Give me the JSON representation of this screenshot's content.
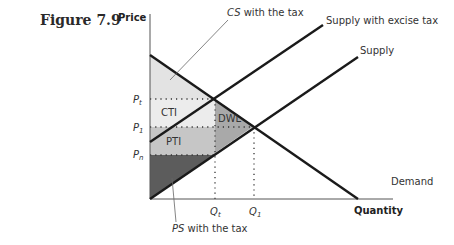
{
  "figure": {
    "title": "Figure 7.9"
  },
  "axes": {
    "y_label": "Price",
    "x_label": "Quantity"
  },
  "curves": {
    "supply_with_tax": "Supply with excise tax",
    "supply": "Supply",
    "demand": "Demand"
  },
  "price_ticks": {
    "pt": "P",
    "pt_sub": "t",
    "p1": "P",
    "p1_sub": "1",
    "pn": "P",
    "pn_sub": "n"
  },
  "quantity_ticks": {
    "qt": "Q",
    "qt_sub": "t",
    "q1": "Q",
    "q1_sub": "1"
  },
  "areas": {
    "cti": "CTI",
    "pti": "PTI",
    "dwl": "DWL"
  },
  "annotations": {
    "cs_italic": "CS",
    "cs_rest": " with the tax",
    "ps_italic": "PS",
    "ps_rest": " with the tax"
  },
  "colors": {
    "cs_fill": "#e6e6e6",
    "cti_fill": "#ececec",
    "pti_fill": "#c4c4c4",
    "dwl_fill": "#a8a8a8",
    "ps_fill": "#5a5a5a",
    "line": "#1a1a1a"
  }
}
